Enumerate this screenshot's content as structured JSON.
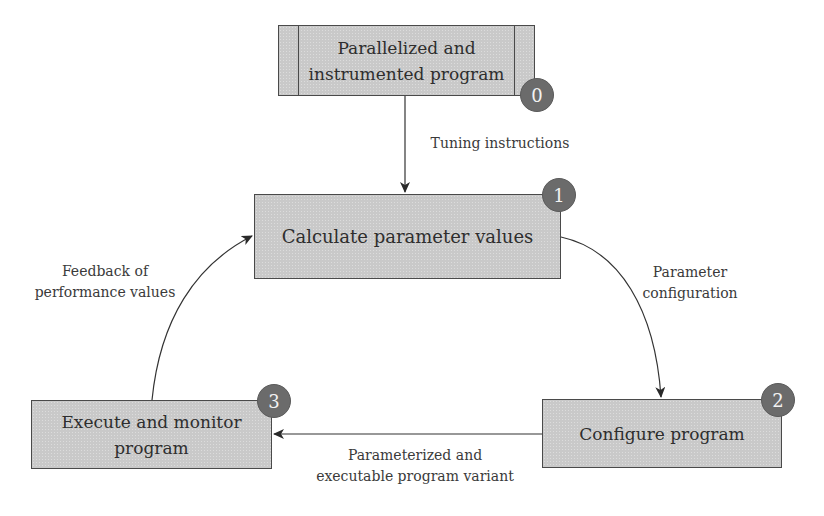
{
  "diagram": {
    "nodes": [
      {
        "id": 0,
        "label": "Parallelized and\ninstrumented program",
        "badge": "0",
        "shape": "predefined-process"
      },
      {
        "id": 1,
        "label": "Calculate parameter values",
        "badge": "1",
        "shape": "process"
      },
      {
        "id": 2,
        "label": "Configure program",
        "badge": "2",
        "shape": "process"
      },
      {
        "id": 3,
        "label": "Execute and monitor\nprogram",
        "badge": "3",
        "shape": "process"
      }
    ],
    "edges": [
      {
        "from": 0,
        "to": 1,
        "label": "Tuning instructions"
      },
      {
        "from": 1,
        "to": 2,
        "label": "Parameter\nconfiguration"
      },
      {
        "from": 2,
        "to": 3,
        "label": "Parameterized and\nexecutable program variant"
      },
      {
        "from": 3,
        "to": 1,
        "label": "Feedback of\nperformance values"
      }
    ]
  },
  "colors": {
    "box_fill": "#c9c9c9",
    "box_border": "#4a4a4a",
    "badge_fill": "#6b6b6b",
    "badge_text": "#f2f2f2",
    "line": "#333333"
  }
}
